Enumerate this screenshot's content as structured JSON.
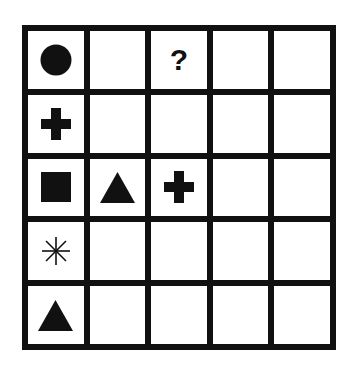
{
  "puzzle": {
    "rows": 5,
    "columns": 5,
    "line_color": "#111111",
    "cell_color": "#ffffff",
    "symbol_color": "#111111",
    "cells": [
      [
        "circle",
        "",
        "question",
        "",
        ""
      ],
      [
        "plus",
        "",
        "",
        "",
        ""
      ],
      [
        "square",
        "triangle",
        "plus",
        "",
        ""
      ],
      [
        "asterisk",
        "",
        "",
        "",
        ""
      ],
      [
        "triangle",
        "",
        "",
        "",
        ""
      ]
    ],
    "question_text": "?"
  }
}
